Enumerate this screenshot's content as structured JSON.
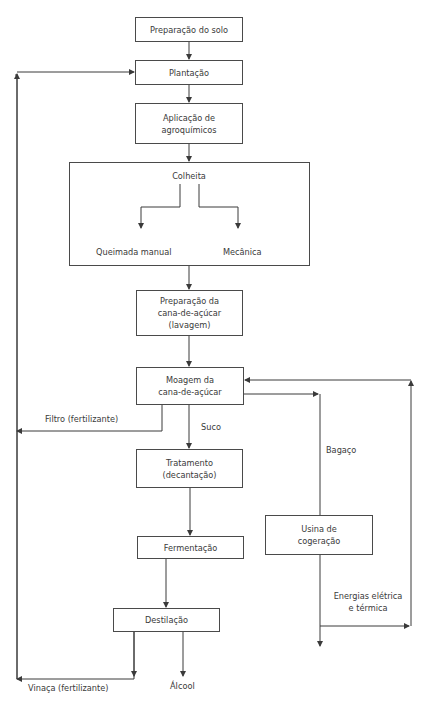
{
  "diagram": {
    "nodes": {
      "preparacao_solo": "Preparação do solo",
      "plantacao": "Plantação",
      "aplicacao": "Aplicação de\nagroquímicos",
      "colheita": "Colheita",
      "queimada_manual": "Queimada manual",
      "mecanica": "Mecânica",
      "preparacao_cana": "Preparação da\ncana-de-açúcar\n(lavagem)",
      "moagem": "Moagem da\ncana-de-açúcar",
      "tratamento": "Tratamento\n(decantação)",
      "fermentacao": "Fermentação",
      "destilacao": "Destilação",
      "usina": "Usina de\ncogeração"
    },
    "edge_labels": {
      "filtro": "Filtro (fertilizante)",
      "suco": "Suco",
      "bagaco": "Bagaço",
      "energias": "Energias elétrica\ne térmica",
      "vinaca": "Vinaça (fertilizante)",
      "alcool": "Álcool"
    },
    "colors": {
      "line": "#3a3a3a",
      "box_border": "#4a4a4a",
      "text": "#3a3a3a",
      "background": "#ffffff"
    }
  }
}
